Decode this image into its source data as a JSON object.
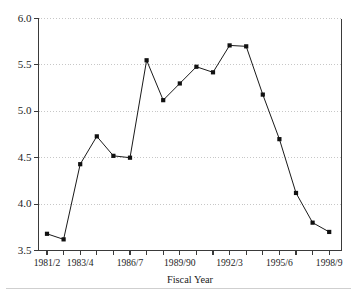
{
  "chart_data": {
    "type": "line",
    "title": "",
    "subtitle": "",
    "xlabel": "Fiscal Year",
    "ylabel": "",
    "ylim": [
      3.5,
      6.0
    ],
    "yticks": [
      3.5,
      4.0,
      4.5,
      5.0,
      5.5,
      6.0
    ],
    "ytick_labels": [
      "3.5",
      "4.0",
      "4.5",
      "5.0",
      "5.5",
      "6.0"
    ],
    "grid": true,
    "grid_axis": "y",
    "legend": false,
    "legend_position": "none",
    "marker": "square",
    "line_color": "#1a1a1a",
    "marker_color": "#111111",
    "grid_color": "#b9b9b9",
    "axis_color": "#3a3a3a",
    "x": [
      "1981/2",
      "1982/3",
      "1983/4",
      "1984/5",
      "1985/6",
      "1986/7",
      "1987/8",
      "1988/9",
      "1989/90",
      "1990/1",
      "1991/2",
      "1992/3",
      "1993/4",
      "1994/5",
      "1995/6",
      "1996/7",
      "1997/8",
      "1998/9"
    ],
    "xtick_labels_shown": [
      "1981/2",
      "1983/4",
      "1986/7",
      "1989/90",
      "1992/3",
      "1995/6",
      "1998/9"
    ],
    "xtick_label_indices": [
      0,
      2,
      5,
      8,
      11,
      14,
      17
    ],
    "values": [
      3.68,
      3.62,
      4.43,
      4.73,
      4.52,
      4.5,
      5.55,
      5.12,
      5.3,
      5.48,
      5.42,
      5.71,
      5.7,
      5.18,
      4.7,
      4.12,
      3.8,
      3.7
    ],
    "series": [
      {
        "name": "",
        "values": [
          3.68,
          3.62,
          4.43,
          4.73,
          4.52,
          4.5,
          5.55,
          5.12,
          5.3,
          5.48,
          5.42,
          5.71,
          5.7,
          5.18,
          4.7,
          4.12,
          3.8,
          3.7
        ]
      }
    ]
  },
  "axes": {
    "x_axis_title": "Fiscal Year"
  }
}
